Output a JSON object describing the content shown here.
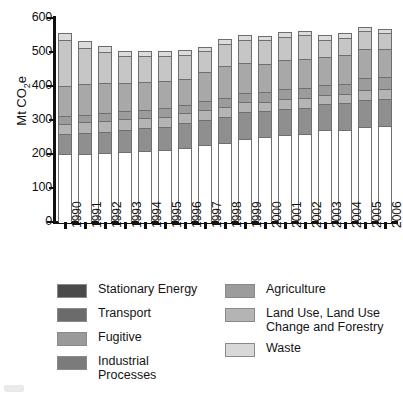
{
  "chart_data": {
    "type": "bar",
    "stacked": true,
    "title": "",
    "subtitle": "",
    "xlabel": "",
    "ylabel": "Mt CO2e",
    "ylabel_parts": {
      "prefix": "Mt CO",
      "sub": "2",
      "suffix": "e"
    },
    "ylim": [
      0,
      600
    ],
    "yticks": [
      0,
      100,
      200,
      300,
      400,
      500,
      600
    ],
    "ytick_labels": [
      "0",
      "100",
      "200",
      "300",
      "400",
      "500",
      "600"
    ],
    "grid": false,
    "legend_position": "bottom",
    "categories": [
      "1990",
      "1991",
      "1992",
      "1993",
      "1994",
      "1995",
      "1996",
      "1997",
      "1998",
      "1999",
      "2000",
      "2001",
      "2002",
      "2003",
      "2004",
      "2005",
      "2006"
    ],
    "series": [
      {
        "name": "Stationary Energy",
        "color": "#ffffff",
        "legend_color": "#4a4a4a",
        "values": [
          199,
          201,
          203,
          205,
          208,
          211,
          219,
          225,
          233,
          245,
          249,
          255,
          258,
          270,
          270,
          279,
          282
        ]
      },
      {
        "name": "Transport",
        "color": "#8f8f8f",
        "legend_color": "#6b6b6b",
        "values": [
          59,
          60,
          63,
          66,
          67,
          68,
          71,
          75,
          76,
          78,
          76,
          78,
          78,
          76,
          79,
          80,
          80
        ]
      },
      {
        "name": "Fugitive",
        "color": "#b4b4b4",
        "legend_color": "#9a9a9a",
        "values": [
          31,
          32,
          32,
          31,
          31,
          31,
          30,
          30,
          30,
          29,
          29,
          29,
          29,
          28,
          28,
          28,
          28
        ]
      },
      {
        "name": "Industrial Processes",
        "color": "#9c9c9c",
        "legend_color": "#7b7b7b",
        "values": [
          22,
          22,
          22,
          23,
          23,
          24,
          24,
          25,
          26,
          26,
          27,
          28,
          29,
          30,
          30,
          36,
          36
        ]
      },
      {
        "name": "Agriculture",
        "color": "#a8a8a8",
        "legend_color": "#9c9c9c",
        "values": [
          89,
          90,
          88,
          85,
          82,
          80,
          78,
          85,
          95,
          90,
          85,
          85,
          84,
          82,
          84,
          85,
          82
        ]
      },
      {
        "name": "Land Use, Land Use\nChange and Forestry",
        "color": "#c6c6c6",
        "legend_color": "#b4b4b4",
        "values": [
          136,
          108,
          93,
          78,
          76,
          73,
          70,
          62,
          63,
          68,
          68,
          69,
          71,
          50,
          51,
          53,
          47
        ]
      },
      {
        "name": "Waste",
        "color": "#dcdcdc",
        "legend_color": "#d8d8d8",
        "values": [
          19,
          18,
          16,
          16,
          15,
          15,
          14,
          14,
          14,
          14,
          14,
          14,
          14,
          14,
          14,
          14,
          14
        ]
      }
    ],
    "totals": [
      555,
      531,
      517,
      504,
      502,
      502,
      506,
      516,
      537,
      550,
      548,
      558,
      563,
      550,
      556,
      575,
      569
    ],
    "annotations": []
  },
  "legend": {
    "columns": [
      {
        "items": [
          {
            "label": "Stationary Energy",
            "color": "#4a4a4a"
          },
          {
            "label": "Transport",
            "color": "#6b6b6b"
          },
          {
            "label": "Fugitive",
            "color": "#9a9a9a"
          },
          {
            "label": "Industrial Processes",
            "color": "#7b7b7b"
          }
        ]
      },
      {
        "items": [
          {
            "label": "Agriculture",
            "color": "#9c9c9c"
          },
          {
            "label": "Land Use, Land Use\nChange and Forestry",
            "color": "#b4b4b4"
          },
          {
            "label": "Waste",
            "color": "#d8d8d8"
          }
        ]
      }
    ]
  }
}
